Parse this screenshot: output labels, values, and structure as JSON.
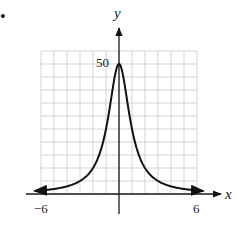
{
  "bullet": "•",
  "chart_data": {
    "type": "line",
    "title": "",
    "xlabel": "x",
    "ylabel": "y",
    "function": "y = 50/(1+x^2)",
    "xlim": [
      -6,
      6
    ],
    "ylim": [
      0,
      55
    ],
    "x_tick_labels": [
      "−6",
      "6"
    ],
    "y_tick_labels": [
      "50"
    ],
    "grid": true,
    "grid_x_step": 1,
    "grid_y_step": 5,
    "legend": null,
    "series": [
      {
        "name": "curve",
        "x": [
          -6.5,
          -6,
          -5,
          -4,
          -3,
          -2,
          -1.5,
          -1,
          -0.5,
          0,
          0.5,
          1,
          1.5,
          2,
          3,
          4,
          5,
          6,
          6.5
        ],
        "values": [
          1.16,
          1.35,
          1.92,
          2.94,
          5.0,
          10.0,
          15.38,
          25.0,
          40.0,
          50.0,
          40.0,
          25.0,
          15.38,
          10.0,
          5.0,
          2.94,
          1.92,
          1.35,
          1.16
        ]
      }
    ],
    "annotations": [
      "arrowheads on both curve ends",
      "arrowheads on positive x and y axes"
    ]
  },
  "colors": {
    "grid": "#c8c8c8",
    "axis": "#1a1a1a",
    "curve": "#111111"
  }
}
